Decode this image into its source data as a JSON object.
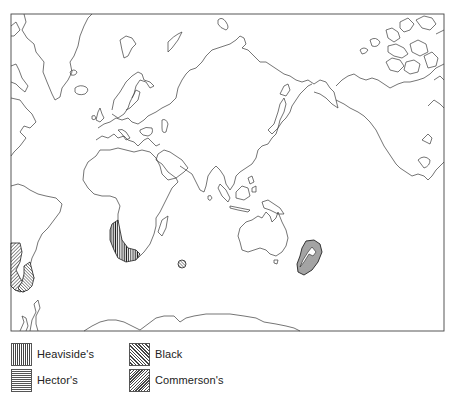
{
  "map": {
    "projection": "world-map-centered-indian-ocean",
    "frame": {
      "x": 11,
      "y": 14,
      "width": 433,
      "height": 317
    },
    "line_color": "#333333",
    "regions": [
      {
        "name": "Heaviside's",
        "location": "south-west Africa coast",
        "pattern": "vertical-lines"
      },
      {
        "name": "Hector's",
        "location": "New Zealand",
        "pattern": "horizontal-lines"
      },
      {
        "name": "Black",
        "location": "southern South America (Chile)",
        "pattern": "diagonal-lines-right"
      },
      {
        "name": "Commerson's",
        "location": "southern South America and Kerguelen",
        "pattern": "diagonal-lines-left"
      }
    ]
  },
  "legend": {
    "items": [
      {
        "label": "Heaviside's",
        "pattern": "vertical-lines"
      },
      {
        "label": "Hector's",
        "pattern": "horizontal-lines"
      },
      {
        "label": "Black",
        "pattern": "diagonal-lines-right"
      },
      {
        "label": "Commerson's",
        "pattern": "diagonal-lines-left"
      }
    ]
  }
}
